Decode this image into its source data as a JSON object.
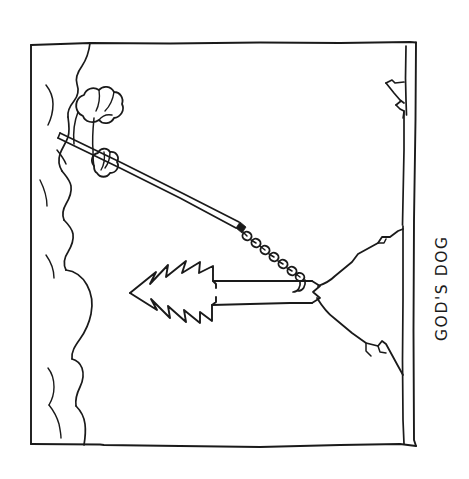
{
  "artwork": {
    "title": "God's Dog",
    "medium": "pen-and-ink cartoon line drawing",
    "caption": "GOD'S DOG",
    "caption_rotation_degrees": -90,
    "background_color": "#ffffff",
    "ink_color": "#1a1a1a",
    "frame": {
      "label": "hand-drawn rectangular panel border",
      "left": 30,
      "top": 42,
      "right": 417,
      "bottom": 446
    },
    "scene_elements": [
      {
        "name": "cloud-bank",
        "label": "Billowing cloud bank along the left edge of the panel",
        "position": "left"
      },
      {
        "name": "divine-hand",
        "label": "Hand emerging from the clouds gripping the leash",
        "position": "upper-left"
      },
      {
        "name": "leash",
        "label": "Straight taut leash running diagonally down to the right",
        "position": "center"
      },
      {
        "name": "chain-collar",
        "label": "Beaded chain section at the end of the leash",
        "position": "center-right"
      },
      {
        "name": "lightning-bolt-dog",
        "label": "Jagged lightning bolt shaped like a dog being walked on the leash",
        "position": "center"
      },
      {
        "name": "mountain-range",
        "label": "Mountain peak silhouette on the right side of the panel",
        "position": "right"
      },
      {
        "name": "upper-peak",
        "label": "Smaller distant peak near the top right corner",
        "position": "top-right"
      }
    ]
  }
}
